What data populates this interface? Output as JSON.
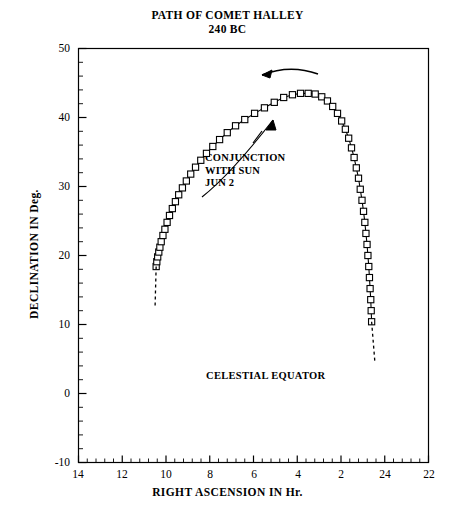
{
  "title": {
    "line1": "PATH OF COMET HALLEY",
    "line2": "240 BC"
  },
  "axes": {
    "xlabel": "RIGHT ASCENSION IN Hr.",
    "ylabel": "DECLINATION IN Deg.",
    "xticks": [
      "14",
      "12",
      "10",
      "8",
      "6",
      "4",
      "2",
      "24",
      "22"
    ],
    "yticks": [
      "50",
      "40",
      "30",
      "20",
      "10",
      "0",
      "-10"
    ]
  },
  "annotations": {
    "conjunction": "CONJUNCTION\nWITH SUN\nJUN 2",
    "equator": "CELESTIAL EQUATOR"
  },
  "chart_data": {
    "type": "line",
    "title": "PATH OF COMET HALLEY 240 BC",
    "xlabel": "RIGHT ASCENSION IN Hr.",
    "ylabel": "DECLINATION IN Deg.",
    "xlim": [
      14,
      6
    ],
    "xlim_note": "axis runs 14 h down to 2 h then wraps 24 h to 22 h (i.e. 14 -> 22 continuous, total span 16 h)",
    "ylim": [
      -10,
      50
    ],
    "xtick_values": [
      14,
      12,
      10,
      8,
      6,
      4,
      2,
      24,
      22
    ],
    "ytick_values": [
      50,
      40,
      30,
      20,
      10,
      0,
      -10
    ],
    "xtick_minor_step": 0.4,
    "ytick_minor_step": 2,
    "grid": false,
    "legend": null,
    "marker": "open-square",
    "series": [
      {
        "name": "Comet Halley apparent path (marked)",
        "points": [
          [
            10.45,
            18.4
          ],
          [
            10.42,
            19.1
          ],
          [
            10.38,
            19.8
          ],
          [
            10.33,
            20.5
          ],
          [
            10.28,
            21.2
          ],
          [
            10.22,
            22.0
          ],
          [
            10.14,
            22.9
          ],
          [
            10.05,
            23.8
          ],
          [
            9.95,
            24.8
          ],
          [
            9.84,
            25.8
          ],
          [
            9.71,
            26.8
          ],
          [
            9.57,
            27.8
          ],
          [
            9.42,
            28.8
          ],
          [
            9.25,
            29.8
          ],
          [
            9.07,
            30.8
          ],
          [
            8.87,
            31.8
          ],
          [
            8.65,
            32.8
          ],
          [
            8.41,
            33.8
          ],
          [
            8.15,
            34.8
          ],
          [
            7.86,
            35.8
          ],
          [
            7.55,
            36.8
          ],
          [
            7.2,
            37.8
          ],
          [
            6.82,
            38.8
          ],
          [
            6.4,
            39.7
          ],
          [
            5.95,
            40.6
          ],
          [
            5.5,
            41.4
          ],
          [
            5.05,
            42.2
          ],
          [
            4.62,
            42.9
          ],
          [
            4.22,
            43.3
          ],
          [
            3.85,
            43.5
          ],
          [
            3.5,
            43.5
          ],
          [
            3.18,
            43.4
          ],
          [
            2.88,
            43.0
          ],
          [
            2.62,
            42.4
          ],
          [
            2.38,
            41.6
          ],
          [
            2.16,
            40.6
          ],
          [
            1.97,
            39.5
          ],
          [
            1.8,
            38.3
          ],
          [
            1.65,
            37.0
          ],
          [
            1.52,
            35.6
          ],
          [
            1.4,
            34.2
          ],
          [
            1.3,
            32.7
          ],
          [
            1.2,
            31.2
          ],
          [
            1.12,
            29.6
          ],
          [
            1.04,
            28.0
          ],
          [
            0.97,
            26.4
          ],
          [
            0.91,
            24.8
          ],
          [
            0.86,
            23.2
          ],
          [
            0.81,
            21.6
          ],
          [
            0.77,
            20.0
          ],
          [
            0.73,
            18.4
          ],
          [
            0.7,
            16.8
          ],
          [
            0.67,
            15.2
          ],
          [
            0.64,
            13.6
          ],
          [
            0.62,
            12.0
          ],
          [
            0.6,
            10.4
          ]
        ]
      },
      {
        "name": "Extrapolated tail (left, dashed)",
        "style": "dashed",
        "points": [
          [
            10.45,
            18.4
          ],
          [
            10.5,
            12.5
          ]
        ]
      },
      {
        "name": "Extrapolated tail (right, dashed)",
        "style": "dashed",
        "points": [
          [
            0.6,
            10.4
          ],
          [
            0.45,
            4.5
          ]
        ]
      }
    ],
    "annotations": [
      {
        "text": "CONJUNCTION WITH SUN JUN 2",
        "points_to_x": 3.9,
        "points_to_y": 43.2
      },
      {
        "text": "CELESTIAL EQUATOR",
        "x": 7.1,
        "y": 2.5
      },
      {
        "text": "direction-of-motion-arrow",
        "from_x": 3.0,
        "from_y": 47.0,
        "to_x": 5.6,
        "to_y": 47.2
      }
    ]
  },
  "colors": {
    "background": "#ffffff",
    "ink": "#000000"
  }
}
